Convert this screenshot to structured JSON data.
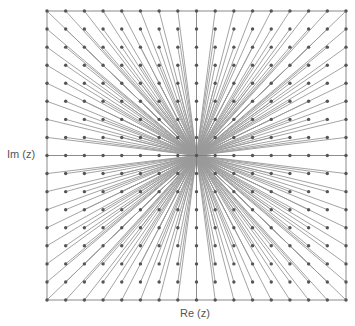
{
  "diagram": {
    "x_axis_label": "Re (z)",
    "y_axis_label": "Im (z)",
    "grid": {
      "columns": 17,
      "rows": 17,
      "left": 47,
      "top": 11,
      "right": 346,
      "bottom": 300,
      "origin_index": [
        8,
        8
      ]
    },
    "colors": {
      "frame": "#8a8a8a",
      "rays": "#9a9a9a",
      "points": "#555555",
      "axes": "#333333"
    }
  }
}
